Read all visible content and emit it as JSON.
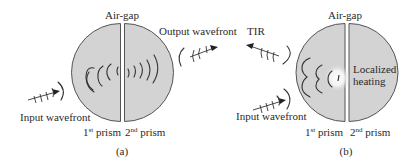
{
  "panels": [
    {
      "id": "a",
      "caption": "(a)",
      "air_gap_label": "Air-gap",
      "input_label": "Input wavefront",
      "output_label": "Output wavefront",
      "prism1": {
        "base": "1",
        "sup": "st",
        "word": " prism"
      },
      "prism2": {
        "base": "2",
        "sup": "nd",
        "word": " prism"
      }
    },
    {
      "id": "b",
      "caption": "(b)",
      "air_gap_label": "Air-gap",
      "input_label": "Input wavefront",
      "reflect_label": "TIR",
      "heating_label_line1": "Localized",
      "heating_label_line2": "heating",
      "prism1": {
        "base": "1",
        "sup": "st",
        "word": " prism"
      },
      "prism2": {
        "base": "2",
        "sup": "nd",
        "word": " prism"
      }
    }
  ],
  "colors": {
    "prism_fill": "#d3d3d3",
    "prism_stroke": "#555555",
    "line": "#333333",
    "hotspot": "#ffffff"
  }
}
